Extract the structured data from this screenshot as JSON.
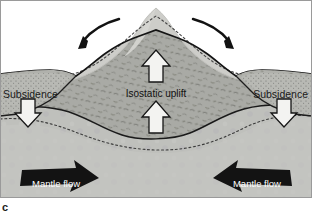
{
  "figure": {
    "panel_letter": "c",
    "width": 312,
    "height": 211
  },
  "labels": {
    "subsidence_left": "Subsidence",
    "subsidence_right": "Subsidence",
    "isostatic_uplift": "Isostatic uplift",
    "mantle_flow_left": "Mantle flow",
    "mantle_flow_right": "Mantle flow"
  },
  "icons": {
    "erosion_arrow_left": "curved-arrow-down-left-icon",
    "erosion_arrow_right": "curved-arrow-down-right-icon",
    "uplift_arrow_upper": "arrow-up-icon",
    "uplift_arrow_lower": "arrow-up-icon",
    "subsidence_arrow_left": "arrow-down-icon",
    "subsidence_arrow_right": "arrow-down-icon",
    "mantle_flow_arrow_left": "block-arrow-right-icon",
    "mantle_flow_arrow_right": "block-arrow-left-icon"
  },
  "colors": {
    "background": "#ffffff",
    "mantle": "#bfc0bc",
    "crust_root": "#a9aaa5",
    "crust_upper": "#b3b4b0",
    "mountain_eroded": "#cdcdc9",
    "sediment": "#b8b9b4",
    "flank_layer": "#b0b1ac",
    "arrow_white": "#f2f2f0",
    "arrow_black": "#171717",
    "outline": "#1a1a1a",
    "dotted_line": "#3a3a3a",
    "frame": "#8c8c8c"
  }
}
